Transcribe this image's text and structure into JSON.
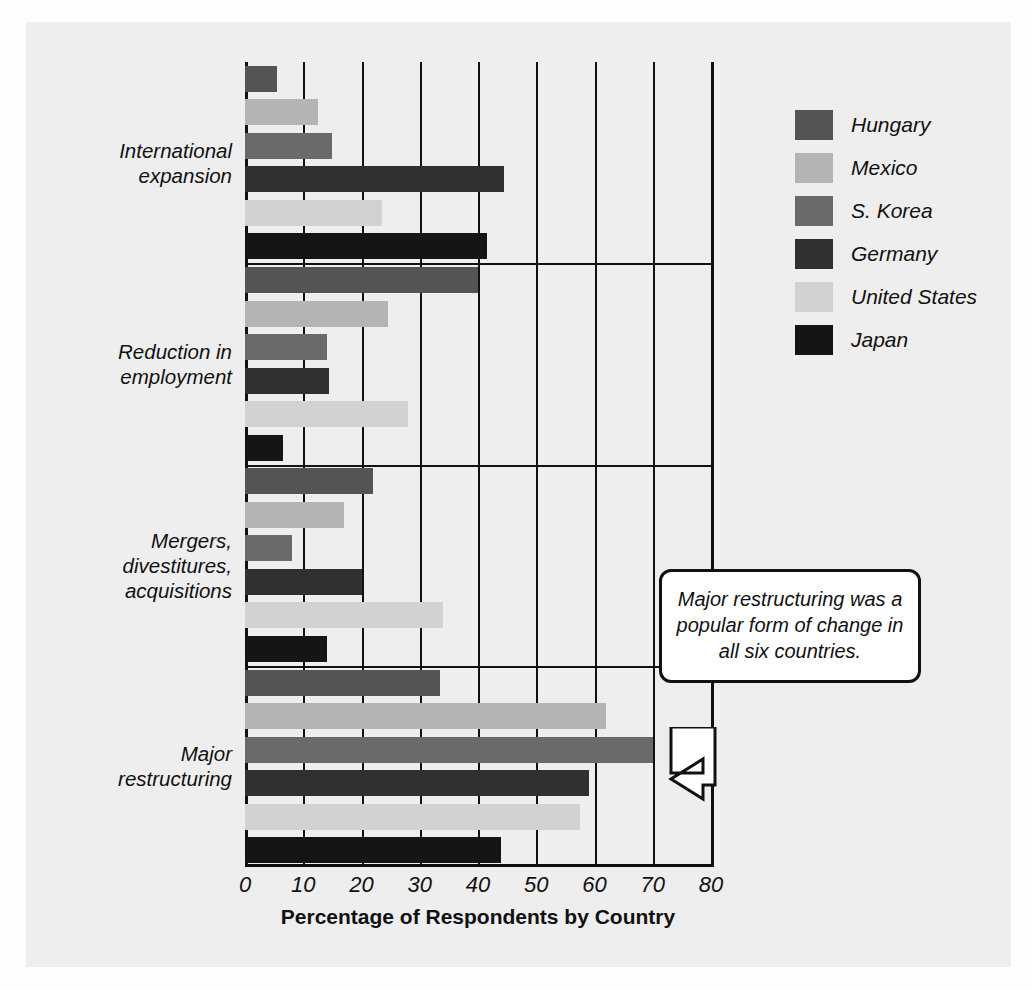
{
  "chart_data": {
    "type": "bar",
    "orientation": "horizontal",
    "title": "",
    "xlabel": "Percentage of Respondents by Country",
    "ylabel": "",
    "xlim": [
      0,
      80
    ],
    "xticks": [
      0,
      10,
      20,
      30,
      40,
      50,
      60,
      70,
      80
    ],
    "grid": true,
    "legend_position": "right",
    "categories": [
      "International expansion",
      "Reduction in employment",
      "Mergers, divestitures, acquisitions",
      "Major restructuring"
    ],
    "series": [
      {
        "name": "Hungary",
        "color": "#545454",
        "values": [
          5.5,
          40.0,
          22.0,
          33.5
        ]
      },
      {
        "name": "Mexico",
        "color": "#b4b4b4",
        "values": [
          12.5,
          24.5,
          17.0,
          62.0
        ]
      },
      {
        "name": "S. Korea",
        "color": "#6a6a6a",
        "values": [
          15.0,
          14.0,
          8.0,
          70.0
        ]
      },
      {
        "name": "Germany",
        "color": "#303030",
        "values": [
          44.5,
          14.5,
          20.0,
          59.0
        ]
      },
      {
        "name": "United States",
        "color": "#d2d2d2",
        "values": [
          23.5,
          28.0,
          34.0,
          57.5
        ]
      },
      {
        "name": "Japan",
        "color": "#151515",
        "values": [
          41.5,
          6.5,
          14.0,
          44.0
        ]
      }
    ],
    "annotations": [
      {
        "text": "Major restructuring was a popular form of change in all six countries.",
        "points_to": "Major restructuring / S. Korea bar"
      }
    ]
  },
  "axis": {
    "x_title": "Percentage of Respondents by Country",
    "tick_labels": [
      "0",
      "10",
      "20",
      "30",
      "40",
      "50",
      "60",
      "70",
      "80"
    ]
  },
  "category_labels": [
    {
      "lines": [
        "International",
        "expansion"
      ]
    },
    {
      "lines": [
        "Reduction in",
        "employment"
      ]
    },
    {
      "lines": [
        "Mergers,",
        "divestitures,",
        "acquisitions"
      ]
    },
    {
      "lines": [
        "Major",
        "restructuring"
      ]
    }
  ],
  "legend": {
    "items": [
      {
        "label": "Hungary",
        "color": "#545454"
      },
      {
        "label": "Mexico",
        "color": "#b4b4b4"
      },
      {
        "label": "S. Korea",
        "color": "#6a6a6a"
      },
      {
        "label": "Germany",
        "color": "#303030"
      },
      {
        "label": "United States",
        "color": "#d2d2d2"
      },
      {
        "label": "Japan",
        "color": "#151515"
      }
    ]
  },
  "callout": {
    "text": "Major restructuring was a popular form of change in all six countries."
  }
}
